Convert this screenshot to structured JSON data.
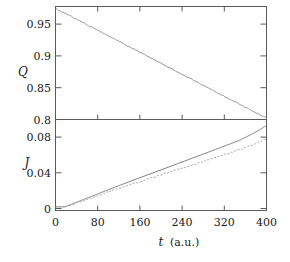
{
  "chart_data": [
    {
      "type": "line",
      "panel": "upper",
      "title": "",
      "xlabel": "t (a.u.)",
      "ylabel": "Q",
      "xlim": [
        0,
        400
      ],
      "ylim": [
        0.8,
        0.978
      ],
      "grid": false,
      "legend": "none",
      "xticks": [
        0,
        80,
        160,
        240,
        320,
        400
      ],
      "xticklabels": [
        "0",
        "80",
        "160",
        "240",
        "320",
        "400"
      ],
      "yticks": [
        0.8,
        0.85,
        0.9,
        0.95
      ],
      "yticklabels": [
        "0.8",
        "0.85",
        "0.9",
        "0.95"
      ],
      "series": [
        {
          "name": "Q",
          "style": "solid-noisy",
          "color": "#8a8a8a",
          "x": [
            0,
            20,
            40,
            60,
            80,
            100,
            120,
            140,
            160,
            180,
            200,
            220,
            240,
            260,
            280,
            300,
            320,
            340,
            360,
            380,
            400
          ],
          "y": [
            0.975,
            0.9665,
            0.958,
            0.9492,
            0.9405,
            0.932,
            0.9232,
            0.9145,
            0.906,
            0.8972,
            0.8885,
            0.88,
            0.8712,
            0.8625,
            0.854,
            0.8452,
            0.8365,
            0.828,
            0.8192,
            0.8105,
            0.802
          ]
        }
      ]
    },
    {
      "type": "line",
      "panel": "lower",
      "title": "",
      "xlabel": "t (a.u.)",
      "ylabel": "J",
      "xlim": [
        0,
        400
      ],
      "ylim": [
        -0.002,
        0.0975
      ],
      "grid": false,
      "legend": "none",
      "xticks": [
        0,
        80,
        160,
        240,
        320,
        400
      ],
      "xticklabels": [
        "0",
        "80",
        "160",
        "240",
        "320",
        "400"
      ],
      "yticks": [
        0,
        0.04,
        0.08
      ],
      "yticklabels": [
        "0",
        "0.04",
        "0.08"
      ],
      "series": [
        {
          "name": "J-solid",
          "style": "solid",
          "color": "#6e6e6e",
          "x": [
            0,
            10,
            18,
            30,
            50,
            80,
            110,
            140,
            170,
            200,
            230,
            260,
            290,
            320,
            350,
            380,
            400
          ],
          "y": [
            0.0,
            0.0,
            0.0,
            0.0028,
            0.0075,
            0.0146,
            0.0216,
            0.0284,
            0.0351,
            0.0417,
            0.0484,
            0.0551,
            0.0618,
            0.0686,
            0.0754,
            0.0846,
            0.0918
          ]
        },
        {
          "name": "J-dashed",
          "style": "dashed-noisy",
          "color": "#9a9a9a",
          "x": [
            0,
            10,
            18,
            30,
            50,
            80,
            110,
            140,
            170,
            200,
            230,
            260,
            290,
            320,
            350,
            380,
            400
          ],
          "y": [
            0.0,
            0.0,
            0.0,
            0.0022,
            0.0062,
            0.0128,
            0.0188,
            0.0246,
            0.0304,
            0.0361,
            0.0419,
            0.0475,
            0.0532,
            0.0589,
            0.0648,
            0.0713,
            0.0772
          ]
        }
      ]
    }
  ],
  "figure": {
    "xlabel_symbol": "t",
    "xlabel_unit": "(a.u.)",
    "upper_panel_label": "Q",
    "lower_panel_label": "J",
    "axis_color": "#5a5a5a"
  }
}
